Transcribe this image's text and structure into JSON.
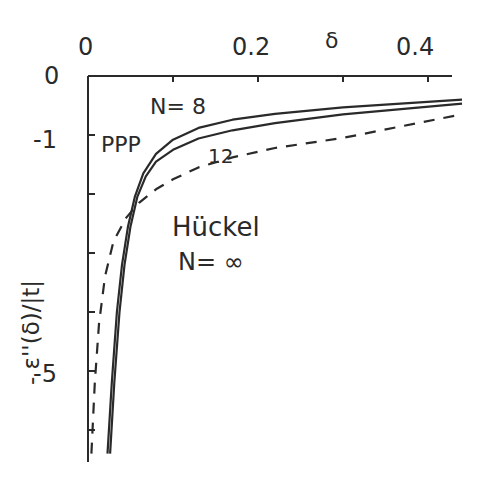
{
  "chart_data": {
    "type": "line",
    "title": "",
    "xlabel": "δ",
    "ylabel": "- ε''(δ)/|t|",
    "xlim": [
      0,
      0.44
    ],
    "ylim": [
      -6.5,
      0
    ],
    "x_axis_position": "top",
    "x_ticks": [
      "0",
      "0.2",
      "0.4"
    ],
    "x_minor_ticks": [
      0.1,
      0.3
    ],
    "y_ticks": [
      "0",
      "-1",
      "-5"
    ],
    "y_minor_ticks": [
      -2,
      -3,
      -4,
      -6
    ],
    "grid": false,
    "series": [
      {
        "name": "PPP N=8",
        "style": "solid",
        "x": [
          0.023,
          0.028,
          0.034,
          0.04,
          0.047,
          0.055,
          0.065,
          0.08,
          0.1,
          0.13,
          0.17,
          0.22,
          0.3,
          0.44
        ],
        "y": [
          -6.4,
          -5.2,
          -4.0,
          -3.2,
          -2.55,
          -2.05,
          -1.65,
          -1.32,
          -1.08,
          -0.88,
          -0.74,
          -0.64,
          -0.53,
          -0.4
        ]
      },
      {
        "name": "PPP N=12",
        "style": "solid",
        "x": [
          0.026,
          0.031,
          0.037,
          0.043,
          0.05,
          0.058,
          0.068,
          0.08,
          0.1,
          0.13,
          0.17,
          0.22,
          0.3,
          0.44
        ],
        "y": [
          -6.4,
          -5.2,
          -4.0,
          -3.2,
          -2.55,
          -2.05,
          -1.7,
          -1.45,
          -1.25,
          -1.06,
          -0.92,
          -0.8,
          -0.65,
          -0.47
        ]
      },
      {
        "name": "Hückel N=∞",
        "style": "dashed",
        "x": [
          0.004,
          0.008,
          0.013,
          0.02,
          0.03,
          0.045,
          0.06,
          0.08,
          0.1,
          0.13,
          0.17,
          0.22,
          0.3,
          0.44
        ],
        "y": [
          -6.4,
          -5.2,
          -4.2,
          -3.4,
          -2.8,
          -2.4,
          -2.15,
          -1.92,
          -1.75,
          -1.55,
          -1.38,
          -1.22,
          -1.05,
          -0.65
        ]
      }
    ],
    "annotations": [
      "N= 8",
      "PPP",
      "12",
      "Hückel",
      "N= ∞"
    ]
  },
  "labels": {
    "x_title": "δ",
    "x_tick_0": "0",
    "x_tick_02": "0.2",
    "x_tick_04": "0.4",
    "y_tick_0": "0",
    "y_tick_m1": "-1",
    "y_tick_m5": "-5",
    "y_title": "- ε''(δ)/|t|",
    "ann_n8": "N= 8",
    "ann_ppp": "PPP",
    "ann_12": "12",
    "ann_huckel": "Hückel",
    "ann_ninf": "N= ∞"
  }
}
